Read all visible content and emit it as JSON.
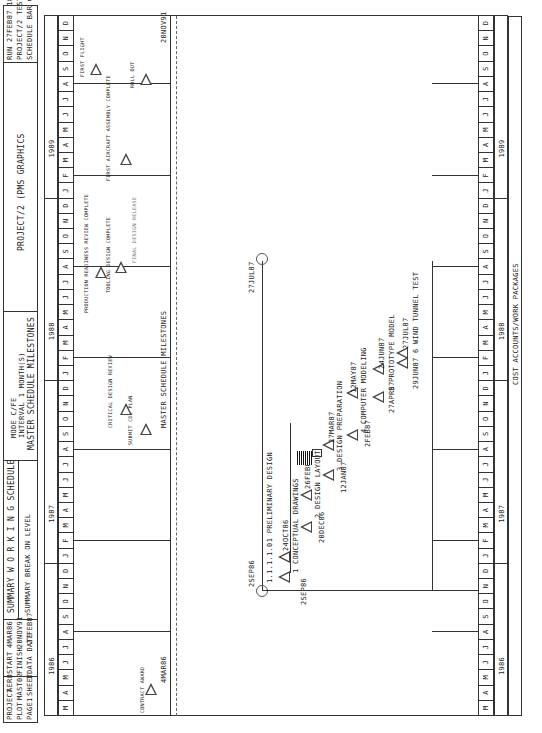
{
  "header": {
    "project_label": "PROJECT",
    "project_value": "AERO",
    "plot_label": "PLOT",
    "plot_value": "MAST02",
    "page_label": "PAGE",
    "page_value": "1",
    "sheet_label": "SHEET",
    "sheet_value": "1",
    "start_label": "START",
    "start_value": "4MAR86",
    "finish_label": "FINISH",
    "finish_value": "20NOV91",
    "data_date_label": "DATA DATE",
    "data_date_value": "27FEB87",
    "title": "SUMMARY  W O R K I N G  SCHEDULE",
    "subtitle": "SUMMARY BREAK ON LEVEL",
    "mode": "MODE C/FE",
    "interval": "INTERVAL  1  MONTH(S)",
    "section_title": "MASTER SCHEDULE MILESTONES",
    "software": "PROJECT/2 (PMS GRAPHICS",
    "run_date": "RUN 27FEB87  18.34",
    "run_project": "PROJECT/2  TEST",
    "chart_type": "SCHEDULE BAR CHART"
  },
  "timeline": {
    "years": [
      {
        "label": "1986",
        "start": 0,
        "count": 10
      },
      {
        "label": "1987",
        "start": 10,
        "count": 12
      },
      {
        "label": "1988",
        "start": 22,
        "count": 12
      },
      {
        "label": "1989",
        "start": 34,
        "count": 12
      }
    ],
    "months": [
      "M",
      "A",
      "M",
      "J",
      "J",
      "A",
      "S",
      "O",
      "N",
      "D",
      "J",
      "F",
      "M",
      "A",
      "M",
      "J",
      "J",
      "A",
      "S",
      "O",
      "N",
      "D",
      "J",
      "F",
      "M",
      "A",
      "M",
      "J",
      "J",
      "A",
      "S",
      "O",
      "N",
      "D",
      "J",
      "F",
      "M",
      "A",
      "M",
      "J",
      "J",
      "A",
      "S",
      "O",
      "N",
      "D"
    ]
  },
  "bottom_section_title": "COST ACCOUNTS/WORK PACKAGES",
  "chart_data": {
    "type": "table",
    "xlabel": "Months (Mar 1986 - Dec 1989)",
    "master_milestones": [
      {
        "label": "CONTRACT AWARD",
        "date": "4MAR86"
      },
      {
        "label": "SUBMIT CDE PLAN",
        "date": ""
      },
      {
        "label": "CRITICAL DESIGN REVIEW",
        "date": ""
      },
      {
        "label": "PRODUCTION READINESS REVIEW COMPLETE",
        "date": ""
      },
      {
        "label": "TOOLING DESIGN COMPLETE",
        "date": ""
      },
      {
        "label": "FIRST AIRCRAFT ASSEMBLY COMPLETE",
        "date": ""
      },
      {
        "label": "FIRST FLIGHT",
        "date": ""
      },
      {
        "label": "ROLL OUT",
        "date": "20NOV91"
      }
    ],
    "work_packages": [
      {
        "id": "1.1.1.1.01",
        "name": "PRELIMINARY DESIGN",
        "start": "25EP86",
        "finish": "27JUL87"
      },
      {
        "id": "1",
        "name": "CONCEPTUAL DRAWINGS",
        "start": "25EP86",
        "finish": "24OCT86"
      },
      {
        "id": "2",
        "name": "DESIGN LAYOUT",
        "start": "20DEC86",
        "finish": "26FEB87"
      },
      {
        "id": "3",
        "name": "DESIGN PREPARATION",
        "start": "12JAN87",
        "finish": "27MAR87"
      },
      {
        "id": "4",
        "name": "COMPUTER MODELING",
        "start": "2FEB87",
        "finish": "12MAY87"
      },
      {
        "id": "5",
        "name": "PROTOTYPE MODEL",
        "start": "27APR87",
        "finish": "24JUN87"
      },
      {
        "id": "6",
        "name": "WIND TUNNEL TEST",
        "start": "29JUN87",
        "finish": "27JUL87"
      }
    ],
    "data_date_marker": "PRELIMINARY DATA DATE"
  },
  "milestones": {
    "contract_award": "CONTRACT AWARD",
    "contract_date": "4MAR86",
    "submit_plan": "SUBMIT CDE PLAN",
    "critical_review": "CRITICAL DESIGN REVIEW",
    "production_review": "PRODUCTION READINESS REVIEW COMPLETE",
    "tooling": "TOOLING DESIGN COMPLETE",
    "final_design": "FINAL DESIGN RELEASE",
    "first_assembly": "FIRST AIRCRAFT ASSEMBLY COMPLETE",
    "first_flight": "FIRST FLIGHT",
    "roll_out": "ROLL OUT",
    "roll_out_date": "20NOV91"
  },
  "tasks": {
    "prelim_id": "1.1.1.1.01  PRELIMINARY DESIGN",
    "prelim_start": "2SEP86",
    "prelim_finish": "27JUL87",
    "t1_label": "1 CONCEPTUAL DRAWINGS",
    "t1_start": "2SEP86",
    "t1_finish": "24OCT86",
    "t2_label": "2 DESIGN LAYOUT",
    "t2_start": "20DEC86",
    "t2_finish": "26FEB87",
    "t3_label": "3 DESIGN PREPARATION",
    "t3_start": "12JAN87",
    "t3_finish": "27MAR87",
    "t4_label": "4 COMPUTER MODELING",
    "t4_start": "2FEB87",
    "t4_finish": "12MAY87",
    "t5_label": "5 PROTOTYPE MODEL",
    "t5_start": "27APR87",
    "t5_finish": "24JUN87",
    "t6_label": "6 WIND TUNNEL TEST",
    "t6_start": "29JUN87",
    "t6_finish": "27JUL87",
    "data_date_tag": "PRELIMINARY DATA DATE"
  }
}
